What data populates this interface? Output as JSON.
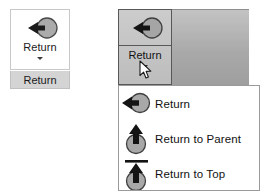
{
  "normal_state": {
    "button": {
      "label": "Return",
      "icon": "return-arrow-circle-icon",
      "dropdown_caret": "chevron-down-icon"
    },
    "caption_box": {
      "label": "Return"
    }
  },
  "active_state": {
    "button": {
      "label": "Return",
      "icon": "return-arrow-circle-icon",
      "dropdown_caret": "chevron-down-icon"
    },
    "cursor": "mouse-pointer"
  },
  "dropdown": {
    "items": [
      {
        "label": "Return",
        "icon": "return-arrow-circle-icon"
      },
      {
        "label": "Return to Parent",
        "icon": "return-to-parent-up-arrow-icon"
      },
      {
        "label": "Return to Top",
        "icon": "return-to-top-arrow-bar-icon"
      }
    ]
  },
  "colors": {
    "icon_fill": "#a8a8a8",
    "icon_stroke": "#2b2b2b",
    "panel_gray": "#b0b0b0",
    "label_box": "#d4d4d4",
    "text": "#111111",
    "border": "#585858"
  }
}
